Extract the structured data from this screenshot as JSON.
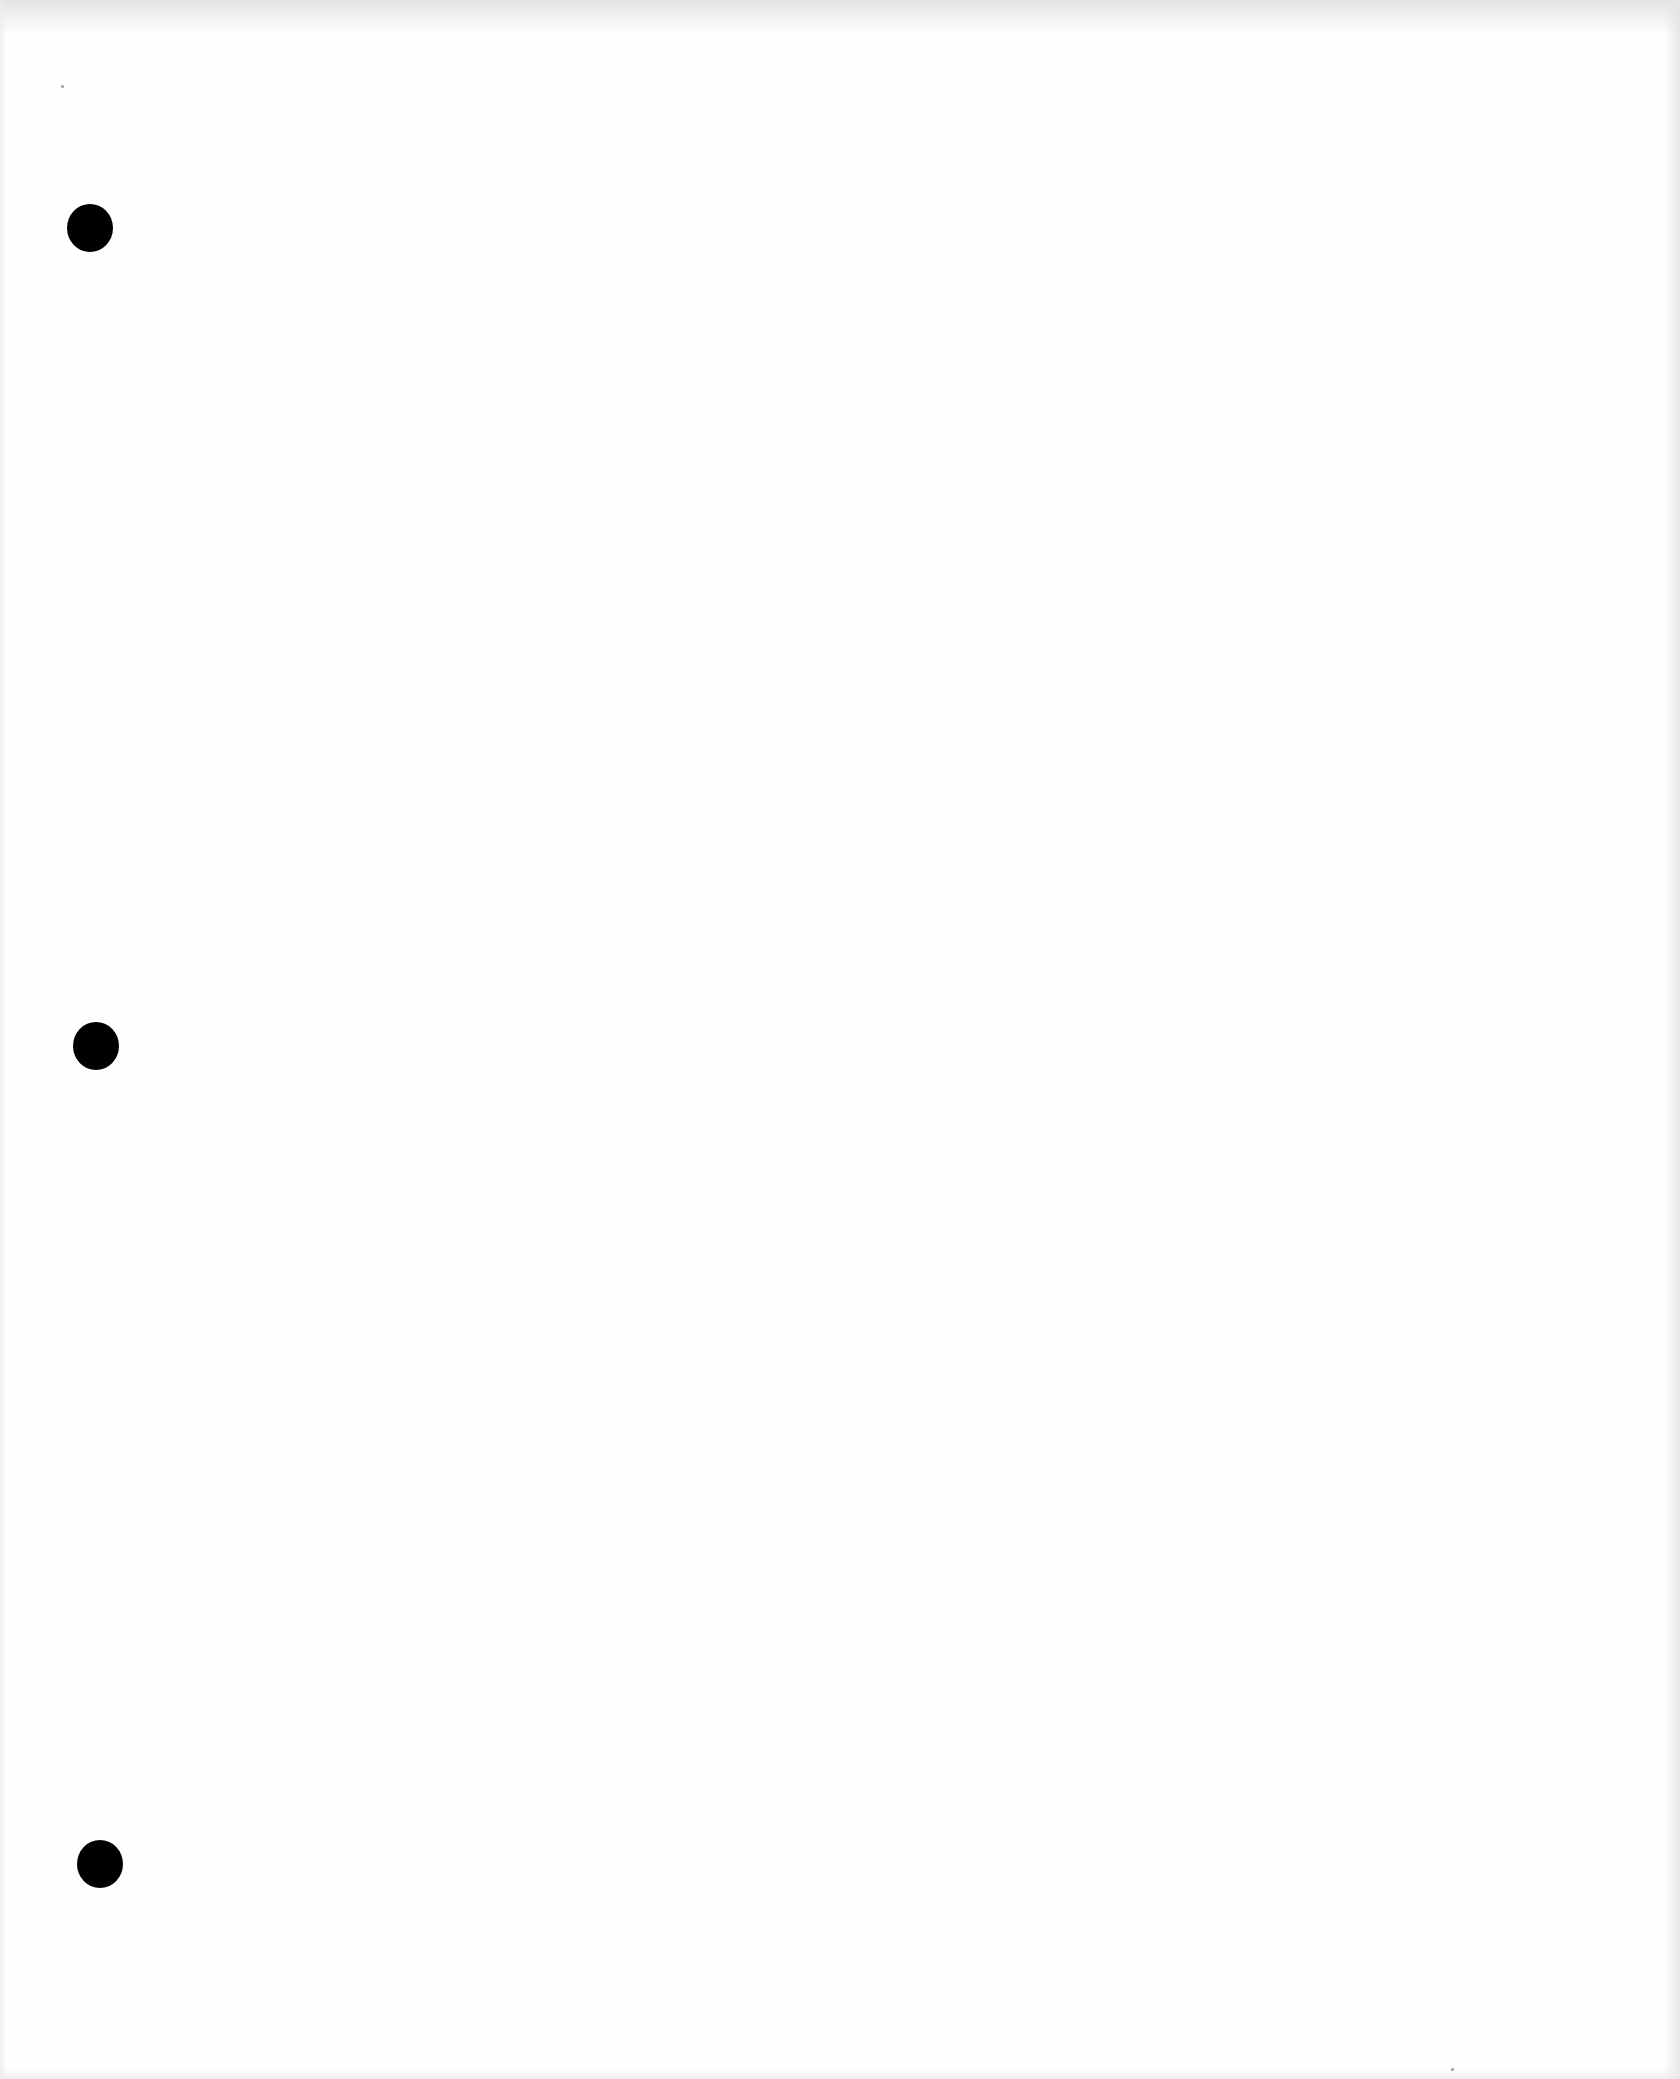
{
  "document": {
    "type": "blank three-hole-punched sheet",
    "background_color": "#fefefe",
    "text_content": []
  },
  "punch_holes": [
    {
      "label": "top-hole",
      "center_x": 90,
      "center_y": 228,
      "diameter": 46,
      "color": "#000000"
    },
    {
      "label": "middle-hole",
      "center_x": 96,
      "center_y": 1046,
      "diameter": 46,
      "color": "#000000"
    },
    {
      "label": "bottom-hole",
      "center_x": 100,
      "center_y": 1864,
      "diameter": 46,
      "color": "#000000"
    }
  ]
}
